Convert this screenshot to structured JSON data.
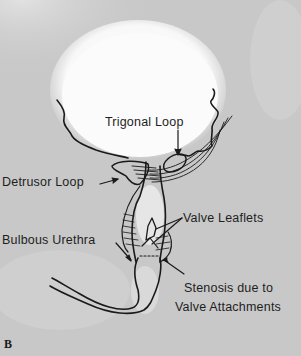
{
  "figure": {
    "panel_letter": "B",
    "colors": {
      "background": "#c9c9c9",
      "bladder_fill": "#fafafa",
      "ink": "#1a1a1a"
    },
    "labels": {
      "trigonal_loop": "Trigonal Loop",
      "detrusor_loop": "Detrusor Loop",
      "valve_leaflets": "Valve Leaflets",
      "bulbous_urethra": "Bulbous Urethra",
      "stenosis_line1": "Stenosis due to",
      "stenosis_line2": "Valve Attachments"
    }
  }
}
